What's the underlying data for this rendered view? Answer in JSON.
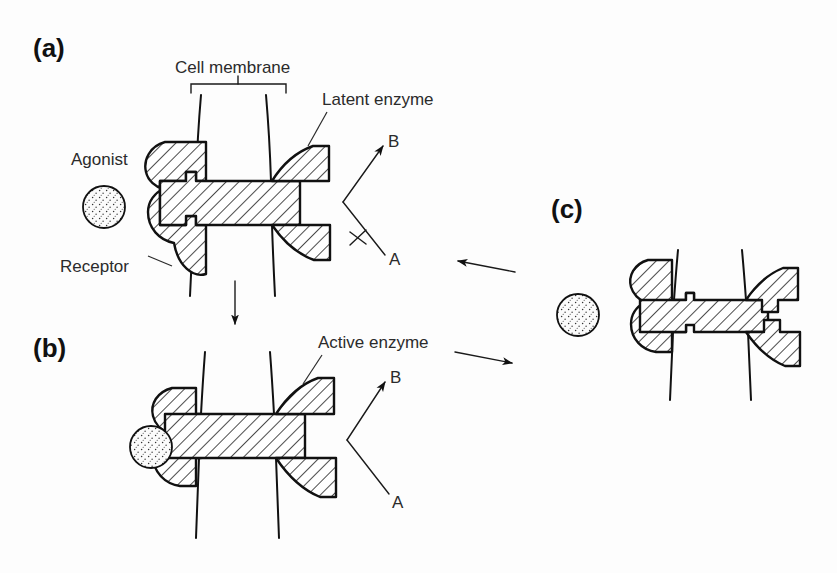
{
  "figure": {
    "title_present": false,
    "background_color": "#fdfdfd",
    "ink_color": "#111111",
    "panels": [
      {
        "id": "a",
        "label": "(a)",
        "state": "unbound-latent",
        "labels": [
          "Cell membrane",
          "Agonist",
          "Receptor",
          "Latent enzyme"
        ],
        "reaction": {
          "substrate": "A",
          "product": "B",
          "blocked": true
        }
      },
      {
        "id": "b",
        "label": "(b)",
        "state": "agonist-bound-active",
        "labels": [
          "Active enzyme"
        ],
        "reaction": {
          "substrate": "A",
          "product": "B",
          "blocked": false
        }
      },
      {
        "id": "c",
        "label": "(c)",
        "state": "dissociated",
        "labels": [],
        "reaction": {
          "substrate": "",
          "product": "",
          "blocked": false
        }
      }
    ]
  },
  "panel_a": {
    "label": "(a)",
    "cell_membrane_label": "Cell membrane",
    "agonist_label": "Agonist",
    "receptor_label": "Receptor",
    "latent_enzyme_label": "Latent enzyme",
    "substrate_label": "A",
    "product_label": "B"
  },
  "panel_b": {
    "label": "(b)",
    "active_enzyme_label": "Active enzyme",
    "substrate_label": "A",
    "product_label": "B"
  },
  "panel_c": {
    "label": "(c)"
  },
  "arrows": {
    "a_to_b": "down-arrow",
    "b_to_c": "right-arrow",
    "c_to_a": "left-arrow",
    "block_mark": "cross-mark"
  },
  "icons": {
    "agonist": "stippled-circle-icon",
    "membrane": "membrane-channel-icon",
    "receptor": "hatched-receptor-icon",
    "enzyme": "hatched-enzyme-icon",
    "bracket": "span-bracket-icon"
  }
}
